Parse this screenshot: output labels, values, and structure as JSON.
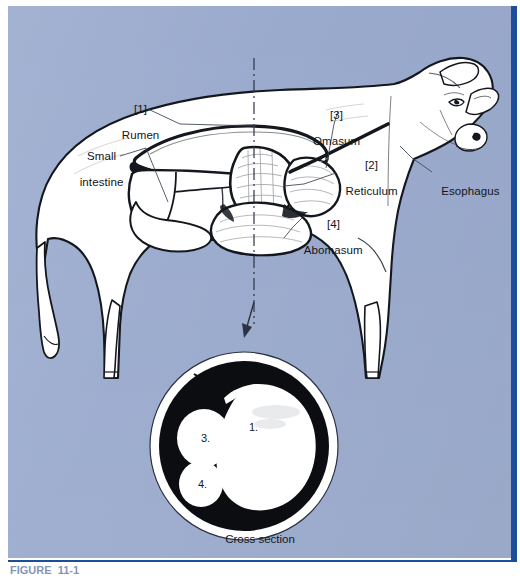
{
  "figure": {
    "kind": "anatomical-illustration",
    "background_color": "#9aaacd",
    "rule_color": "#1b4f9c",
    "ink_color": "#111418",
    "fill_color": "#ffffff"
  },
  "labels": {
    "rumen": {
      "index": "[1]",
      "name": "Rumen"
    },
    "reticulum": {
      "index": "[2]",
      "name": "Reticulum"
    },
    "omasum": {
      "index": "[3]",
      "name": "Omasum"
    },
    "abomasum": {
      "index": "[4]",
      "name": "Abomasum"
    },
    "small_intestine": {
      "line1": "Small",
      "line2": "intestine"
    },
    "esophagus": {
      "name": "Esophagus"
    }
  },
  "cross_section": {
    "caption": "Cross section",
    "markers": [
      {
        "id": "1",
        "label": "1."
      },
      {
        "id": "3",
        "label": "3."
      },
      {
        "id": "4",
        "label": "4."
      }
    ]
  },
  "caption": {
    "text": "FIGURE  11-1    "
  }
}
